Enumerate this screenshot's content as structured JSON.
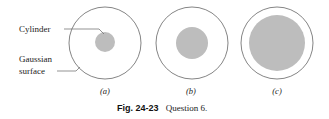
{
  "figure": {
    "caption_number": "Fig. 24-23",
    "caption_text": "Question 6.",
    "labels": {
      "cylinder": "Cylinder",
      "gaussian_line1": "Gaussian",
      "gaussian_line2": "surface"
    },
    "panels": [
      {
        "label": "(a)",
        "outer_radius": 36,
        "inner_radius": 10
      },
      {
        "label": "(b)",
        "outer_radius": 36,
        "inner_radius": 16
      },
      {
        "label": "(c)",
        "outer_radius": 36,
        "inner_radius": 28
      }
    ],
    "colors": {
      "outline": "#777777",
      "fill": "#bdbdbd",
      "leader": "#666666"
    }
  }
}
